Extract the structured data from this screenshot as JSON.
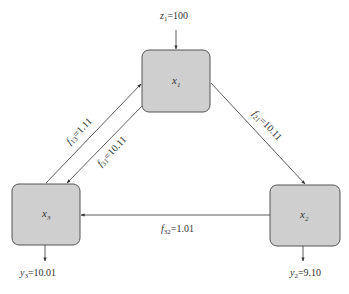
{
  "diagram": {
    "type": "flow-network",
    "colors": {
      "node_fill": "#cfcfcf",
      "node_stroke": "#555555",
      "edge": "#333333",
      "text": "#333333",
      "background": "#ffffff"
    },
    "nodes": [
      {
        "id": "x1",
        "var": "x",
        "sub": "1"
      },
      {
        "id": "x2",
        "var": "x",
        "sub": "2"
      },
      {
        "id": "x3",
        "var": "x",
        "sub": "3"
      }
    ],
    "external_inputs": [
      {
        "to": "x1",
        "var": "z",
        "sub": "1",
        "value": "=100"
      }
    ],
    "outputs": [
      {
        "from": "x2",
        "var": "y",
        "sub": "2",
        "value": "=9.10"
      },
      {
        "from": "x3",
        "var": "y",
        "sub": "3",
        "value": "=10.01"
      }
    ],
    "edges": [
      {
        "from": "x3",
        "to": "x1",
        "var": "f",
        "sub": "13",
        "value": "=1.11"
      },
      {
        "from": "x1",
        "to": "x3",
        "var": "f",
        "sub": "31",
        "value": "=10.11"
      },
      {
        "from": "x1",
        "to": "x2",
        "var": "f",
        "sub": "21",
        "value": "=10.11"
      },
      {
        "from": "x2",
        "to": "x3",
        "var": "f",
        "sub": "32",
        "value": "=1.01"
      }
    ]
  }
}
